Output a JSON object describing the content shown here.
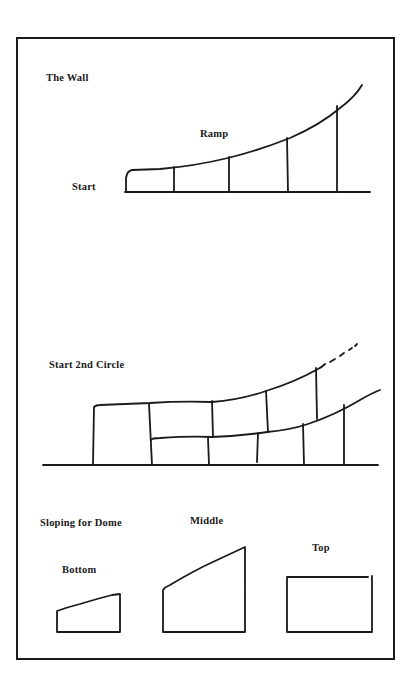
{
  "diagram": {
    "border_color": "#1a1a1a",
    "sections": [
      {
        "id": "the-wall",
        "labels": {
          "title": "The Wall",
          "ramp": "Ramp",
          "start": "Start"
        }
      },
      {
        "id": "second-circle",
        "labels": {
          "title": "Start 2nd Circle"
        }
      },
      {
        "id": "sloping-dome",
        "labels": {
          "title": "Sloping for Dome",
          "bottom": "Bottom",
          "middle": "Middle",
          "top": "Top"
        }
      }
    ]
  }
}
